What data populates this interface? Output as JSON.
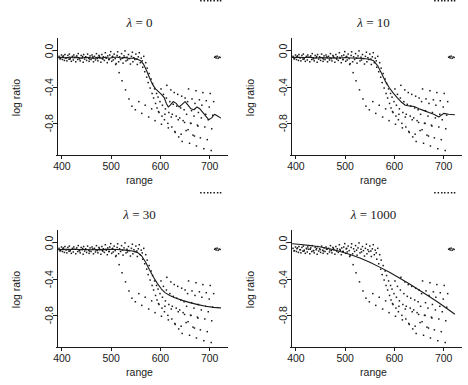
{
  "figure": {
    "width": 468,
    "height": 385,
    "background": "#ffffff",
    "ink": "#1a1a1a",
    "layout": "2x2 grid of scatter plots with smoothing-spline fits"
  },
  "chart_data": [
    {
      "type": "scatter",
      "panel_index": 0,
      "title": "λ = 0",
      "title_symbol": "λ",
      "title_value": "0",
      "xlabel": "range",
      "ylabel": "log ratio",
      "xlim": [
        390,
        725
      ],
      "ylim": [
        -1.15,
        0.12
      ],
      "xticks": [
        400,
        500,
        600,
        700
      ],
      "xticklabels": [
        "400",
        "500",
        "600",
        "700"
      ],
      "yticks": [
        0.0,
        -0.4,
        -0.8
      ],
      "yticklabels": [
        "0.0",
        "-0.4",
        "-0.8"
      ],
      "grid": false,
      "legend": "none",
      "series": [
        {
          "name": "observations",
          "kind": "scatter",
          "marker": "dot",
          "note": "same data in all four panels"
        },
        {
          "name": "smoothing spline fit",
          "kind": "line",
          "lambda": 0,
          "note": "very wiggly, near-interpolating fit",
          "x": [
            393,
            400,
            408,
            416,
            424,
            432,
            440,
            448,
            456,
            464,
            472,
            480,
            488,
            496,
            504,
            512,
            520,
            528,
            536,
            544,
            552,
            560,
            566,
            572,
            578,
            584,
            590,
            596,
            602,
            608,
            612,
            616,
            620,
            626,
            632,
            638,
            644,
            650,
            656,
            662,
            668,
            674,
            680,
            686,
            692,
            698,
            704,
            710,
            716,
            722
          ],
          "y": [
            -0.075,
            -0.07,
            -0.08,
            -0.068,
            -0.078,
            -0.072,
            -0.082,
            -0.07,
            -0.075,
            -0.085,
            -0.072,
            -0.08,
            -0.07,
            -0.082,
            -0.074,
            -0.068,
            -0.08,
            -0.072,
            -0.085,
            -0.078,
            -0.09,
            -0.11,
            -0.15,
            -0.22,
            -0.3,
            -0.37,
            -0.42,
            -0.45,
            -0.48,
            -0.52,
            -0.58,
            -0.62,
            -0.6,
            -0.56,
            -0.58,
            -0.62,
            -0.59,
            -0.56,
            -0.6,
            -0.64,
            -0.65,
            -0.62,
            -0.64,
            -0.68,
            -0.72,
            -0.76,
            -0.74,
            -0.7,
            -0.72,
            -0.74
          ]
        }
      ]
    },
    {
      "type": "scatter",
      "panel_index": 1,
      "title": "λ = 10",
      "title_symbol": "λ",
      "title_value": "10",
      "xlabel": "range",
      "ylabel": "log ratio",
      "xlim": [
        390,
        725
      ],
      "ylim": [
        -1.15,
        0.12
      ],
      "xticks": [
        400,
        500,
        600,
        700
      ],
      "xticklabels": [
        "400",
        "500",
        "600",
        "700"
      ],
      "yticks": [
        0.0,
        -0.4,
        -0.8
      ],
      "yticklabels": [
        "0.0",
        "-0.4",
        "-0.8"
      ],
      "grid": false,
      "legend": "none",
      "series": [
        {
          "name": "observations",
          "kind": "scatter",
          "marker": "dot",
          "note": "same data in all four panels"
        },
        {
          "name": "smoothing spline fit",
          "kind": "line",
          "lambda": 10,
          "note": "moderately wiggly fit",
          "x": [
            393,
            405,
            417,
            429,
            441,
            453,
            465,
            477,
            489,
            501,
            513,
            525,
            537,
            549,
            558,
            566,
            574,
            582,
            590,
            598,
            606,
            614,
            622,
            630,
            640,
            650,
            660,
            670,
            680,
            690,
            700,
            710,
            722
          ],
          "y": [
            -0.072,
            -0.07,
            -0.074,
            -0.072,
            -0.078,
            -0.074,
            -0.08,
            -0.076,
            -0.078,
            -0.074,
            -0.078,
            -0.08,
            -0.084,
            -0.092,
            -0.11,
            -0.165,
            -0.25,
            -0.34,
            -0.41,
            -0.47,
            -0.52,
            -0.565,
            -0.6,
            -0.608,
            -0.615,
            -0.64,
            -0.66,
            -0.68,
            -0.7,
            -0.73,
            -0.69,
            -0.7,
            -0.705
          ]
        }
      ]
    },
    {
      "type": "scatter",
      "panel_index": 2,
      "title": "λ = 30",
      "title_symbol": "λ",
      "title_value": "30",
      "xlabel": "range",
      "ylabel": "log ratio",
      "xlim": [
        390,
        725
      ],
      "ylim": [
        -1.15,
        0.12
      ],
      "xticks": [
        400,
        500,
        600,
        700
      ],
      "xticklabels": [
        "400",
        "500",
        "600",
        "700"
      ],
      "yticks": [
        0.0,
        -0.4,
        -0.8
      ],
      "yticklabels": [
        "0.0",
        "-0.4",
        "-0.8"
      ],
      "grid": false,
      "legend": "none",
      "series": [
        {
          "name": "observations",
          "kind": "scatter",
          "marker": "dot",
          "note": "same data in all four panels"
        },
        {
          "name": "smoothing spline fit",
          "kind": "line",
          "lambda": 30,
          "note": "smooth sigmoid fit",
          "x": [
            393,
            410,
            427,
            444,
            461,
            478,
            495,
            512,
            529,
            543,
            554,
            562,
            570,
            578,
            586,
            594,
            602,
            610,
            620,
            632,
            646,
            660,
            676,
            692,
            708,
            722
          ],
          "y": [
            -0.075,
            -0.072,
            -0.074,
            -0.073,
            -0.076,
            -0.075,
            -0.072,
            -0.074,
            -0.08,
            -0.09,
            -0.108,
            -0.145,
            -0.215,
            -0.3,
            -0.38,
            -0.45,
            -0.51,
            -0.552,
            -0.585,
            -0.612,
            -0.638,
            -0.66,
            -0.682,
            -0.7,
            -0.712,
            -0.718
          ]
        }
      ]
    },
    {
      "type": "scatter",
      "panel_index": 3,
      "title": "λ = 1000",
      "title_symbol": "λ",
      "title_value": "1000",
      "xlabel": "range",
      "ylabel": "log ratio",
      "xlim": [
        390,
        725
      ],
      "ylim": [
        -1.15,
        0.12
      ],
      "xticks": [
        400,
        500,
        600,
        700
      ],
      "xticklabels": [
        "400",
        "500",
        "600",
        "700"
      ],
      "yticks": [
        0.0,
        -0.4,
        -0.8
      ],
      "yticklabels": [
        "0.0",
        "-0.4",
        "-0.8"
      ],
      "grid": false,
      "legend": "none",
      "series": [
        {
          "name": "observations",
          "kind": "scatter",
          "marker": "dot",
          "note": "same data in all four panels"
        },
        {
          "name": "smoothing spline fit",
          "kind": "line",
          "lambda": 1000,
          "note": "heavily over-smoothed, nearly parabolic fit",
          "x": [
            393,
            410,
            430,
            450,
            470,
            490,
            510,
            530,
            550,
            570,
            590,
            610,
            630,
            650,
            670,
            690,
            710,
            722
          ],
          "y": [
            -0.01,
            -0.018,
            -0.03,
            -0.046,
            -0.068,
            -0.095,
            -0.128,
            -0.168,
            -0.215,
            -0.268,
            -0.325,
            -0.388,
            -0.452,
            -0.52,
            -0.59,
            -0.662,
            -0.738,
            -0.785
          ]
        }
      ]
    }
  ],
  "scatter_points": {
    "note": "shared observation cloud, identical across all four panels",
    "x": [
      394,
      397,
      399,
      401,
      403,
      405,
      406,
      408,
      410,
      412,
      414,
      415,
      417,
      419,
      421,
      423,
      424,
      426,
      428,
      430,
      432,
      433,
      435,
      437,
      439,
      441,
      443,
      444,
      446,
      448,
      450,
      452,
      454,
      455,
      457,
      459,
      461,
      463,
      464,
      466,
      468,
      470,
      472,
      473,
      475,
      477,
      479,
      481,
      483,
      484,
      486,
      488,
      490,
      492,
      493,
      495,
      497,
      499,
      501,
      503,
      504,
      506,
      508,
      510,
      512,
      513,
      515,
      517,
      519,
      521,
      523,
      524,
      526,
      528,
      530,
      532,
      533,
      535,
      537,
      539,
      541,
      543,
      544,
      546,
      548,
      550,
      552,
      553,
      555,
      557,
      559,
      561,
      563,
      564,
      566,
      568,
      570,
      572,
      573,
      575,
      577,
      579,
      581,
      583,
      584,
      586,
      588,
      590,
      592,
      593,
      595,
      597,
      599,
      601,
      603,
      604,
      606,
      608,
      610,
      612,
      613,
      615,
      617,
      619,
      621,
      623,
      624,
      626,
      628,
      630,
      632,
      633,
      635,
      637,
      639,
      641,
      643,
      644,
      646,
      648,
      650,
      652,
      653,
      655,
      657,
      659,
      661,
      663,
      664,
      666,
      668,
      670,
      672,
      673,
      675,
      677,
      679,
      681,
      683,
      684,
      686,
      688,
      690,
      692,
      693,
      695,
      697,
      699,
      701,
      703,
      704,
      706,
      708,
      710,
      712,
      713,
      715,
      717,
      719,
      721,
      396,
      402,
      409,
      416,
      422,
      429,
      436,
      442,
      449,
      456,
      462,
      469,
      476,
      482,
      489,
      496,
      502,
      509,
      516,
      522,
      529,
      536,
      542,
      549,
      556,
      562,
      569,
      576,
      582,
      589,
      596,
      602,
      609,
      616,
      622,
      629,
      636,
      642,
      649,
      656,
      662,
      669,
      676,
      682,
      689,
      696,
      702,
      709,
      716,
      722
    ],
    "y": [
      -0.06,
      -0.085,
      -0.045,
      -0.095,
      -0.055,
      -0.105,
      -0.04,
      -0.075,
      -0.11,
      -0.05,
      -0.09,
      -0.035,
      -0.08,
      -0.115,
      -0.06,
      -0.1,
      -0.045,
      -0.07,
      -0.12,
      -0.055,
      -0.095,
      -0.03,
      -0.085,
      -0.11,
      -0.05,
      -0.075,
      -0.125,
      -0.04,
      -0.09,
      -0.065,
      -0.105,
      -0.035,
      -0.08,
      -0.115,
      -0.055,
      -0.095,
      -0.045,
      -0.07,
      -0.12,
      -0.06,
      -0.1,
      -0.03,
      -0.085,
      -0.11,
      -0.05,
      -0.075,
      -0.125,
      -0.04,
      -0.09,
      -0.065,
      -0.105,
      -0.02,
      -0.08,
      -0.13,
      -0.055,
      -0.095,
      -0.045,
      -0.008,
      -0.115,
      -0.06,
      -0.1,
      -0.035,
      -0.085,
      -0.14,
      -0.05,
      -0.01,
      -0.12,
      -0.065,
      -0.095,
      -0.03,
      -0.08,
      -0.135,
      -0.055,
      0.0,
      -0.11,
      -0.07,
      -0.1,
      -0.04,
      -0.085,
      -0.145,
      -0.06,
      -0.015,
      -0.12,
      -0.075,
      -0.095,
      -0.035,
      -0.09,
      -0.15,
      -0.065,
      -0.02,
      -0.13,
      -0.08,
      -0.11,
      -0.18,
      -0.06,
      -0.23,
      -0.13,
      -0.29,
      -0.19,
      -0.35,
      -0.25,
      -0.41,
      -0.31,
      -0.47,
      -0.36,
      -0.52,
      -0.42,
      -0.58,
      -0.47,
      -0.63,
      -0.51,
      -0.68,
      -0.56,
      -0.42,
      -0.72,
      -0.6,
      -0.48,
      -0.76,
      -0.64,
      -0.52,
      -0.38,
      -0.8,
      -0.68,
      -0.56,
      -0.43,
      -0.84,
      -0.7,
      -0.59,
      -0.46,
      -0.9,
      -0.72,
      -0.61,
      -0.48,
      -0.95,
      -0.74,
      -0.63,
      -0.5,
      -1.0,
      -0.77,
      -0.65,
      -0.52,
      -0.88,
      -0.7,
      -0.56,
      -0.42,
      -1.02,
      -0.8,
      -0.66,
      -0.53,
      -0.93,
      -0.72,
      -0.58,
      -0.44,
      -1.05,
      -0.82,
      -0.68,
      -0.54,
      -0.96,
      -0.74,
      -0.6,
      -0.46,
      -1.08,
      -0.84,
      -0.7,
      -0.55,
      -0.98,
      -0.76,
      -0.62,
      -0.47,
      -1.1,
      -0.86,
      -0.71,
      -0.56,
      -0.07,
      -0.062,
      -0.078,
      -0.058,
      -0.082,
      -0.068,
      -0.072,
      -0.088,
      -0.064,
      -0.076,
      -0.092,
      -0.066,
      -0.07,
      -0.086,
      -0.062,
      -0.074,
      -0.09,
      -0.068,
      -0.078,
      -0.06,
      -0.084,
      -0.072,
      -0.094,
      -0.066,
      -0.15,
      -0.24,
      -0.33,
      -0.43,
      -0.53,
      -0.61,
      -0.65,
      -0.56,
      -0.69,
      -0.6,
      -0.73,
      -0.64,
      -0.77,
      -0.67,
      -0.81,
      -0.7,
      -0.85,
      -0.73,
      -0.89,
      -0.76,
      -0.92,
      -0.79,
      -0.87,
      -0.8,
      -0.94,
      -0.83
    ]
  },
  "panel_geometry": {
    "plot_left": 57,
    "plot_right": 222,
    "plot_top": 40,
    "plot_bottom": 155,
    "title_y": 27,
    "xlabel_y": 184,
    "ylabel_x": 20
  }
}
